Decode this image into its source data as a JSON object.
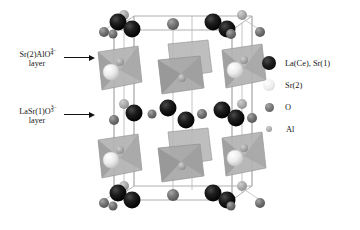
{
  "figure": {
    "type": "crystal-structure-diagram",
    "background": "#ffffff"
  },
  "annotations": [
    {
      "id": "sr2-alo4-layer",
      "formula_prefix": "Sr(2)AlO",
      "formula_sub": "4",
      "formula_sup": "3−",
      "second_line": "layer",
      "x": 10,
      "y": 50,
      "arrow": {
        "x": 64,
        "y": 58,
        "length": 30
      }
    },
    {
      "id": "lasr1-o3-layer",
      "formula_prefix": "LaSr(1)O",
      "formula_sub": "3",
      "formula_sup": "3−",
      "second_line": "layer",
      "x": 10,
      "y": 107,
      "arrow": {
        "x": 64,
        "y": 115,
        "length": 30
      }
    }
  ],
  "legend": {
    "x": 262,
    "y": 52,
    "entries": [
      {
        "label": "La(Ce), Sr(1)",
        "color": "#141414",
        "size": 14,
        "atom": "la-ce-sr1"
      },
      {
        "label": "Sr(2)",
        "color": "#e2e2e2",
        "size": 12,
        "atom": "sr2"
      },
      {
        "label": "O",
        "color": "#6e6e6e",
        "size": 9,
        "atom": "o"
      },
      {
        "label": "Al",
        "color": "#a8a8a8",
        "size": 6,
        "atom": "al"
      }
    ]
  },
  "colors": {
    "la_ce_sr1": "#141414",
    "sr2": "#e8e8e8",
    "sr2_edge": "#b5b5b5",
    "oxygen": "#6e6e6e",
    "aluminium": "#a8a8a8",
    "polyhedron_light": "#b9b9b9",
    "polyhedron_mid": "#a3a3a3",
    "polyhedron_dark": "#8f8f8f",
    "cell_edge": "#9a9a9a",
    "bond": "#b0b0b0"
  },
  "structure": {
    "cell_box": {
      "front": [
        [
          112,
          30
        ],
        [
          236,
          30
        ],
        [
          236,
          200
        ],
        [
          112,
          200
        ]
      ],
      "back": [
        [
          134,
          16
        ],
        [
          252,
          16
        ],
        [
          252,
          186
        ],
        [
          134,
          186
        ]
      ]
    },
    "layers": [
      {
        "name": "top-lasr1-o3",
        "y": 22,
        "kind": "lasr1-o3"
      },
      {
        "name": "upper-sr2-alo4",
        "y": 70,
        "kind": "sr2-alo4"
      },
      {
        "name": "middle-lasr1-o3",
        "y": 112,
        "kind": "lasr1-o3"
      },
      {
        "name": "lower-sr2-alo4",
        "y": 158,
        "kind": "sr2-alo4"
      },
      {
        "name": "bottom-lasr1-o3",
        "y": 200,
        "kind": "lasr1-o3"
      }
    ],
    "atom_counts": {
      "la_ce_sr1": 16,
      "sr2": 4,
      "oxygen": 26,
      "aluminium": 12
    }
  }
}
